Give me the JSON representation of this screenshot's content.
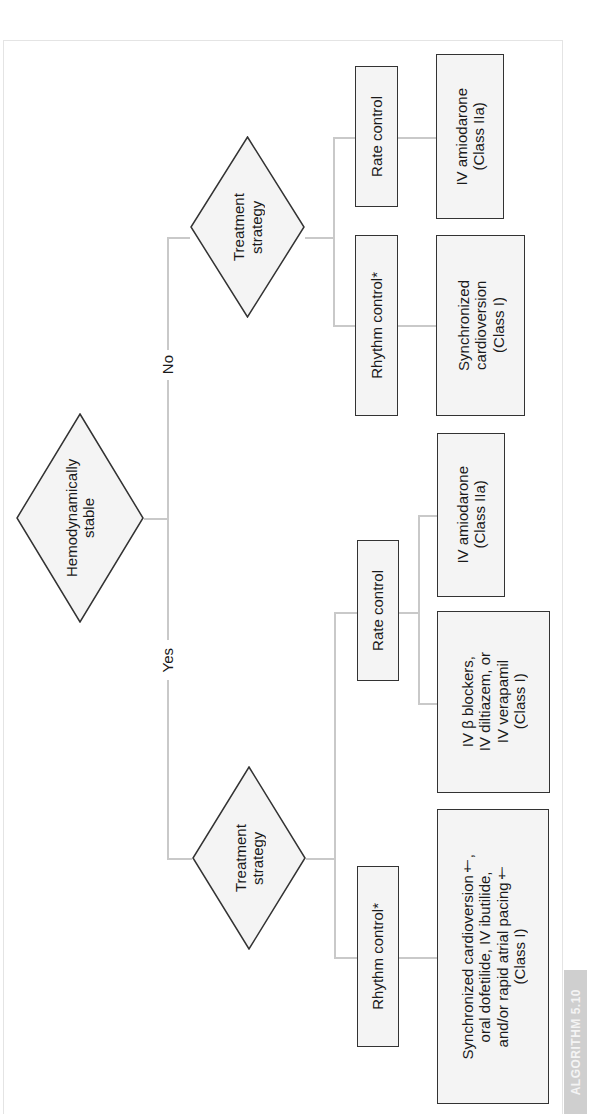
{
  "figure": {
    "tag": "ALGORITHM 5.10",
    "orientation": "rotated 90° clockwise; text reads bottom-to-top"
  },
  "nodes": {
    "root": {
      "type": "decision",
      "label": "Hemodynamically\nstable"
    },
    "branch_yes_label": "Yes",
    "branch_no_label": "No",
    "yes": {
      "decision": {
        "type": "decision",
        "label": "Treatment\nstrategy"
      },
      "rhythm_control": {
        "label": "Rhythm control*",
        "treatment": "Synchronized cardioversion†,\noral dofetilide, IV ibutilide,\nand/or rapid atrial pacing†\n(Class I)"
      },
      "rate_control": {
        "label": "Rate control",
        "treatments": [
          "IV β blockers,\nIV diltiazem, or\nIV verapamil\n(Class I)",
          "IV amiodarone\n(Class IIa)"
        ]
      }
    },
    "no": {
      "decision": {
        "type": "decision",
        "label": "Treatment\nstrategy"
      },
      "rhythm_control": {
        "label": "Rhythm control*",
        "treatment": "Synchronized\ncardioversion\n(Class I)"
      },
      "rate_control": {
        "label": "Rate control",
        "treatment": "IV amiodarone\n(Class IIa)"
      }
    }
  },
  "colors": {
    "box_fill": "#f4f4f4",
    "box_border": "#333333",
    "connector": "#c9c9c9",
    "tag_bg": "#cfcfcf",
    "tag_text": "#f4f4f4"
  }
}
